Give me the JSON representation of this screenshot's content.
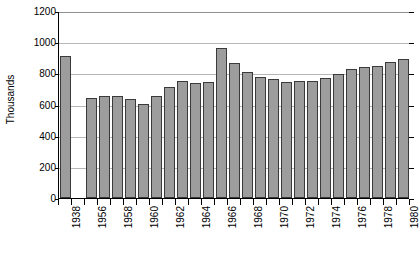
{
  "chart_data": {
    "type": "bar",
    "title": "",
    "subtitle": "",
    "xlabel": "",
    "ylabel": "Thousands",
    "ylim": [
      0,
      1200
    ],
    "ytick_step": 200,
    "yticks": [
      "0",
      "200",
      "400",
      "600",
      "800",
      "1000",
      "1200"
    ],
    "grid": true,
    "legend": null,
    "bar_color": "#9d9d9d",
    "bar_edge_color": "#3a3a3a",
    "gridline_color": "#b7b7b7",
    "axis_color": "#000000",
    "note": "A single 1938 bar is separated by a blank gap from the continuous 1956-1980 series",
    "categories": [
      "1938",
      "",
      "1956",
      "1957",
      "1958",
      "1959",
      "1960",
      "1961",
      "1962",
      "1963",
      "1964",
      "1965",
      "1966",
      "1967",
      "1968",
      "1969",
      "1970",
      "1971",
      "1972",
      "1973",
      "1974",
      "1975",
      "1976",
      "1977",
      "1978",
      "1979",
      "1980"
    ],
    "values": [
      910,
      null,
      640,
      655,
      655,
      635,
      605,
      655,
      715,
      750,
      740,
      745,
      960,
      865,
      810,
      775,
      765,
      745,
      750,
      750,
      770,
      795,
      830,
      840,
      845,
      870,
      895
    ],
    "visible_xtick_labels": [
      "1938",
      "1956",
      "1958",
      "1960",
      "1962",
      "1964",
      "1966",
      "1968",
      "1970",
      "1972",
      "1974",
      "1976",
      "1978",
      "1980"
    ]
  }
}
